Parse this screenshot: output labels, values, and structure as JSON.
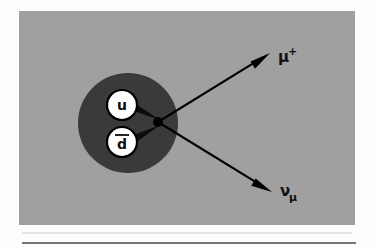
{
  "figure": {
    "name": "pion-decay-feynman-style-diagram",
    "background_color": "#fdfdfd",
    "panel": {
      "fill": "#a0a0a0",
      "x": 19,
      "y": 11,
      "width": 336,
      "height": 214
    },
    "hadron_blob": {
      "label": "hadron-blob",
      "fill": "#3a3a3a",
      "cx": 128,
      "cy": 123,
      "r": 50
    },
    "vertex": {
      "label": "interaction-vertex",
      "cx": 158,
      "cy": 122,
      "r": 5,
      "color": "#000000"
    },
    "quarks": [
      {
        "symbol": "u",
        "name": "up-quark",
        "overline": false,
        "cx": 122,
        "cy": 105,
        "r": 15,
        "circle_fill": "#ffffff",
        "circle_stroke": "#000000"
      },
      {
        "symbol": "d",
        "name": "anti-down-quark",
        "overline": true,
        "cx": 122,
        "cy": 142,
        "r": 15,
        "circle_fill": "#ffffff",
        "circle_stroke": "#000000"
      }
    ],
    "outgoing_particles": [
      {
        "name": "muon-plus",
        "base_symbol": "μ",
        "superscript": "+",
        "subscript": "",
        "label_x": 278,
        "label_y": 62,
        "arrow_from_x": 158,
        "arrow_from_y": 122,
        "arrow_to_x": 270,
        "arrow_to_y": 53,
        "color": "#000000"
      },
      {
        "name": "muon-neutrino",
        "base_symbol": "ν",
        "superscript": "",
        "subscript": "μ",
        "label_x": 280,
        "label_y": 196,
        "arrow_from_x": 158,
        "arrow_from_y": 122,
        "arrow_to_x": 272,
        "arrow_to_y": 192,
        "color": "#000000"
      }
    ],
    "rules": [
      {
        "name": "upper-hairline-rule",
        "x1": 22,
        "y1": 233,
        "x2": 352,
        "y2": 233,
        "color": "#c9c9c9",
        "thickness": 1
      },
      {
        "name": "lower-separator-rule",
        "x1": 22,
        "y1": 243,
        "x2": 356,
        "y2": 243,
        "color": "#4a4a4a",
        "thickness": 1.4
      }
    ]
  }
}
